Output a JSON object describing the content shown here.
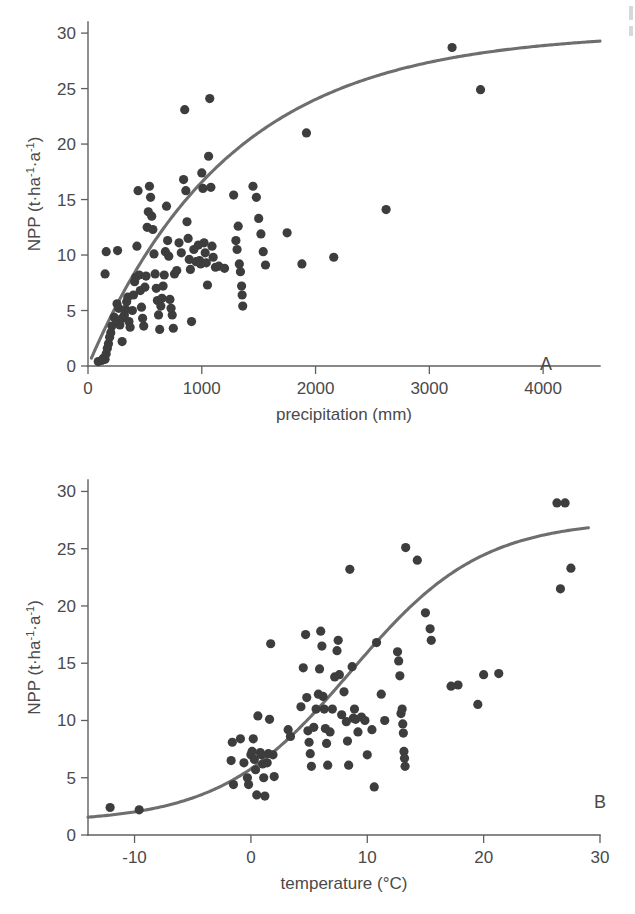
{
  "figure": {
    "background_color": "#ffffff",
    "point_color": "#3d3d3d",
    "curve_color": "#6e6e6e",
    "axis_color": "#5f5f5f"
  },
  "panels": [
    {
      "id": "A",
      "letter": "A",
      "xlabel": "precipitation (mm)",
      "ylabel_parts": {
        "main": "NPP (t·ha",
        "sup1": "-1",
        "mid": "·a",
        "sup2": "-1",
        "close": ")"
      },
      "ylabel": "NPP (t·ha⁻¹·a⁻¹)",
      "xticks": [
        0,
        1000,
        2000,
        3000,
        4000
      ],
      "xtick_labels": [
        "0",
        "1000",
        "2000",
        "3000",
        "4000"
      ],
      "yticks": [
        0,
        5,
        10,
        15,
        20,
        25,
        30
      ],
      "ytick_labels": [
        "0",
        "5",
        "10",
        "15",
        "20",
        "25",
        "30"
      ],
      "xlim": [
        0,
        4500
      ],
      "ylim": [
        0,
        31
      ]
    },
    {
      "id": "B",
      "letter": "B",
      "xlabel": "temperature (°C)",
      "ylabel_parts": {
        "main": "NPP (t·ha",
        "sup1": "-1",
        "mid": "·a",
        "sup2": "-1",
        "close": ")"
      },
      "ylabel": "NPP (t·ha⁻¹·a⁻¹)",
      "xticks": [
        -10,
        0,
        10,
        20,
        30
      ],
      "xtick_labels": [
        "-10",
        "0",
        "10",
        "20",
        "30"
      ],
      "yticks": [
        0,
        5,
        10,
        15,
        20,
        25,
        30
      ],
      "ytick_labels": [
        "0",
        "5",
        "10",
        "15",
        "20",
        "25",
        "30"
      ],
      "xlim": [
        -14,
        30
      ],
      "ylim": [
        0,
        31
      ]
    }
  ],
  "chart_data": [
    {
      "type": "scatter",
      "panel": "A",
      "title": "NPP vs precipitation",
      "xlabel": "precipitation (mm)",
      "ylabel": "NPP (t·ha⁻¹·a⁻¹)",
      "xlim": [
        0,
        4500
      ],
      "ylim": [
        0,
        31
      ],
      "xticks": [
        0,
        1000,
        2000,
        3000,
        4000
      ],
      "yticks": [
        0,
        5,
        10,
        15,
        20,
        25,
        30
      ],
      "grid": false,
      "legend": "none",
      "annotations": [
        "A"
      ],
      "points": [
        [
          90,
          0.4
        ],
        [
          120,
          0.5
        ],
        [
          135,
          0.7
        ],
        [
          150,
          0.6
        ],
        [
          160,
          1.1
        ],
        [
          170,
          1.6
        ],
        [
          180,
          2.0
        ],
        [
          190,
          2.6
        ],
        [
          200,
          3.0
        ],
        [
          210,
          3.6
        ],
        [
          150,
          8.3
        ],
        [
          160,
          10.3
        ],
        [
          260,
          10.4
        ],
        [
          230,
          4.4
        ],
        [
          250,
          4.1
        ],
        [
          255,
          5.6
        ],
        [
          270,
          5.2
        ],
        [
          280,
          3.7
        ],
        [
          300,
          2.2
        ],
        [
          300,
          4.3
        ],
        [
          320,
          4.6
        ],
        [
          330,
          5.1
        ],
        [
          340,
          5.8
        ],
        [
          350,
          6.2
        ],
        [
          360,
          4.0
        ],
        [
          370,
          3.5
        ],
        [
          390,
          5.0
        ],
        [
          400,
          6.4
        ],
        [
          410,
          7.6
        ],
        [
          420,
          8.0
        ],
        [
          430,
          10.8
        ],
        [
          440,
          15.8
        ],
        [
          450,
          8.2
        ],
        [
          460,
          6.8
        ],
        [
          470,
          5.3
        ],
        [
          480,
          4.3
        ],
        [
          490,
          3.6
        ],
        [
          500,
          7.1
        ],
        [
          510,
          8.1
        ],
        [
          520,
          12.5
        ],
        [
          530,
          13.9
        ],
        [
          540,
          16.2
        ],
        [
          550,
          15.2
        ],
        [
          560,
          13.5
        ],
        [
          570,
          12.3
        ],
        [
          580,
          10.1
        ],
        [
          590,
          8.3
        ],
        [
          600,
          7.0
        ],
        [
          610,
          5.9
        ],
        [
          620,
          4.6
        ],
        [
          630,
          3.3
        ],
        [
          640,
          5.4
        ],
        [
          650,
          6.1
        ],
        [
          660,
          7.2
        ],
        [
          670,
          8.2
        ],
        [
          680,
          10.3
        ],
        [
          690,
          14.4
        ],
        [
          700,
          11.3
        ],
        [
          710,
          9.9
        ],
        [
          720,
          6.0
        ],
        [
          730,
          5.2
        ],
        [
          740,
          4.6
        ],
        [
          750,
          3.4
        ],
        [
          760,
          8.3
        ],
        [
          780,
          8.6
        ],
        [
          800,
          11.1
        ],
        [
          820,
          10.2
        ],
        [
          840,
          16.8
        ],
        [
          850,
          23.1
        ],
        [
          860,
          15.8
        ],
        [
          870,
          13.0
        ],
        [
          880,
          11.5
        ],
        [
          890,
          9.6
        ],
        [
          900,
          8.7
        ],
        [
          910,
          4.0
        ],
        [
          930,
          10.5
        ],
        [
          950,
          9.4
        ],
        [
          970,
          10.9
        ],
        [
          980,
          9.5
        ],
        [
          990,
          9.2
        ],
        [
          1000,
          17.4
        ],
        [
          1010,
          16.0
        ],
        [
          1020,
          11.1
        ],
        [
          1030,
          10.2
        ],
        [
          1040,
          9.3
        ],
        [
          1050,
          7.3
        ],
        [
          1060,
          18.9
        ],
        [
          1070,
          24.1
        ],
        [
          1080,
          16.1
        ],
        [
          1090,
          10.8
        ],
        [
          1100,
          9.8
        ],
        [
          1120,
          8.9
        ],
        [
          1150,
          9.0
        ],
        [
          1200,
          8.8
        ],
        [
          1280,
          15.4
        ],
        [
          1300,
          11.3
        ],
        [
          1310,
          10.5
        ],
        [
          1320,
          12.6
        ],
        [
          1330,
          9.2
        ],
        [
          1340,
          8.5
        ],
        [
          1350,
          7.2
        ],
        [
          1355,
          6.4
        ],
        [
          1360,
          5.4
        ],
        [
          1450,
          16.2
        ],
        [
          1480,
          15.2
        ],
        [
          1500,
          13.3
        ],
        [
          1520,
          11.9
        ],
        [
          1540,
          10.3
        ],
        [
          1560,
          9.1
        ],
        [
          1750,
          12.0
        ],
        [
          1880,
          9.2
        ],
        [
          1920,
          21.0
        ],
        [
          2160,
          9.8
        ],
        [
          2620,
          14.1
        ],
        [
          3200,
          28.7
        ],
        [
          3450,
          24.9
        ]
      ],
      "fit_curve": {
        "model": "saturating",
        "description": "NPP = 30.1 * (1 - exp(-x/1250))",
        "asymptote": 30.1,
        "scale": 1250,
        "x_range": [
          30,
          4500
        ]
      }
    },
    {
      "type": "scatter",
      "panel": "B",
      "title": "NPP vs temperature",
      "xlabel": "temperature (°C)",
      "ylabel": "NPP (t·ha⁻¹·a⁻¹)",
      "xlim": [
        -14,
        30
      ],
      "ylim": [
        0,
        31
      ],
      "xticks": [
        -10,
        0,
        10,
        20,
        30
      ],
      "yticks": [
        0,
        5,
        10,
        15,
        20,
        25,
        30
      ],
      "grid": false,
      "legend": "none",
      "annotations": [
        "B"
      ],
      "points": [
        [
          -12.1,
          2.4
        ],
        [
          -9.6,
          2.2
        ],
        [
          -1.6,
          8.1
        ],
        [
          -1.7,
          6.5
        ],
        [
          -1.5,
          4.4
        ],
        [
          -0.9,
          8.4
        ],
        [
          -0.6,
          6.3
        ],
        [
          -0.3,
          5.0
        ],
        [
          -0.2,
          4.4
        ],
        [
          0.0,
          7.0
        ],
        [
          0.1,
          7.3
        ],
        [
          0.2,
          8.4
        ],
        [
          0.3,
          6.6
        ],
        [
          0.4,
          5.7
        ],
        [
          0.5,
          3.5
        ],
        [
          0.6,
          10.4
        ],
        [
          0.8,
          7.2
        ],
        [
          0.9,
          7.0
        ],
        [
          1.0,
          6.2
        ],
        [
          1.1,
          5.0
        ],
        [
          1.2,
          3.4
        ],
        [
          1.4,
          6.3
        ],
        [
          1.5,
          7.1
        ],
        [
          1.6,
          10.1
        ],
        [
          1.7,
          16.7
        ],
        [
          1.9,
          7.0
        ],
        [
          2.0,
          5.1
        ],
        [
          3.2,
          9.2
        ],
        [
          3.4,
          8.6
        ],
        [
          4.3,
          11.2
        ],
        [
          4.5,
          14.6
        ],
        [
          4.7,
          17.5
        ],
        [
          4.8,
          12.0
        ],
        [
          4.9,
          9.1
        ],
        [
          5.0,
          8.1
        ],
        [
          5.1,
          7.1
        ],
        [
          5.2,
          6.0
        ],
        [
          5.4,
          9.4
        ],
        [
          5.6,
          11.0
        ],
        [
          5.8,
          12.3
        ],
        [
          5.9,
          14.5
        ],
        [
          6.0,
          17.8
        ],
        [
          6.1,
          16.5
        ],
        [
          6.2,
          12.1
        ],
        [
          6.3,
          11.0
        ],
        [
          6.4,
          9.3
        ],
        [
          6.5,
          8.0
        ],
        [
          6.6,
          6.1
        ],
        [
          6.8,
          9.0
        ],
        [
          7.0,
          11.0
        ],
        [
          7.2,
          13.8
        ],
        [
          7.4,
          16.1
        ],
        [
          7.5,
          17.0
        ],
        [
          7.6,
          14.0
        ],
        [
          7.8,
          10.5
        ],
        [
          8.0,
          12.5
        ],
        [
          8.2,
          9.9
        ],
        [
          8.3,
          8.2
        ],
        [
          8.4,
          6.1
        ],
        [
          8.5,
          23.2
        ],
        [
          8.7,
          14.7
        ],
        [
          8.8,
          10.2
        ],
        [
          8.9,
          11.0
        ],
        [
          9.0,
          10.1
        ],
        [
          9.2,
          9.0
        ],
        [
          9.5,
          10.3
        ],
        [
          9.8,
          10.0
        ],
        [
          10.0,
          7.0
        ],
        [
          10.4,
          9.2
        ],
        [
          10.6,
          4.2
        ],
        [
          10.8,
          16.8
        ],
        [
          11.2,
          12.3
        ],
        [
          11.5,
          10.0
        ],
        [
          12.6,
          16.0
        ],
        [
          12.7,
          15.2
        ],
        [
          12.8,
          13.9
        ],
        [
          12.9,
          10.6
        ],
        [
          13.0,
          11.0
        ],
        [
          13.05,
          9.7
        ],
        [
          13.1,
          8.9
        ],
        [
          13.15,
          7.3
        ],
        [
          13.2,
          6.7
        ],
        [
          13.25,
          6.0
        ],
        [
          13.3,
          25.1
        ],
        [
          14.3,
          24.0
        ],
        [
          15.0,
          19.4
        ],
        [
          15.4,
          18.0
        ],
        [
          15.5,
          17.0
        ],
        [
          17.2,
          13.0
        ],
        [
          17.8,
          13.1
        ],
        [
          19.5,
          11.4
        ],
        [
          20.0,
          14.0
        ],
        [
          21.3,
          14.1
        ],
        [
          26.3,
          29.0
        ],
        [
          27.0,
          29.0
        ],
        [
          26.6,
          21.5
        ],
        [
          27.5,
          23.3
        ]
      ],
      "fit_curve": {
        "model": "logistic",
        "description": "NPP = 1.1 + 26.4 / (1 + exp(-(x - 8.6)/5.6))",
        "baseline": 1.1,
        "amplitude": 26.4,
        "midpoint": 8.6,
        "steepness": 5.6,
        "x_range": [
          -14,
          29
        ]
      }
    }
  ]
}
